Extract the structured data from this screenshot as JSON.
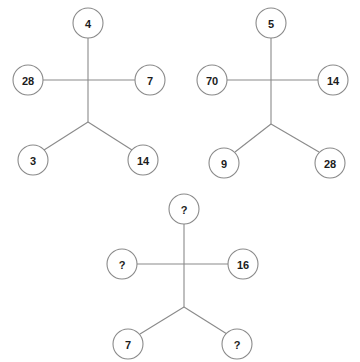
{
  "background_color": "#ffffff",
  "line_color": "#8a8a8a",
  "text_color": "#1c1c1c",
  "circle_fill": "#ffffff",
  "unknown_marker": "?",
  "figures": [
    {
      "id": "figure-1",
      "nodes": {
        "top": "4",
        "left": "28",
        "right": "7",
        "bottom_left": "3",
        "bottom_right": "14"
      }
    },
    {
      "id": "figure-2",
      "nodes": {
        "top": "5",
        "left": "70",
        "right": "14",
        "bottom_left": "9",
        "bottom_right": "28"
      }
    },
    {
      "id": "figure-3",
      "nodes": {
        "top": "?",
        "left": "?",
        "right": "16",
        "bottom_left": "7",
        "bottom_right": "?"
      }
    }
  ]
}
